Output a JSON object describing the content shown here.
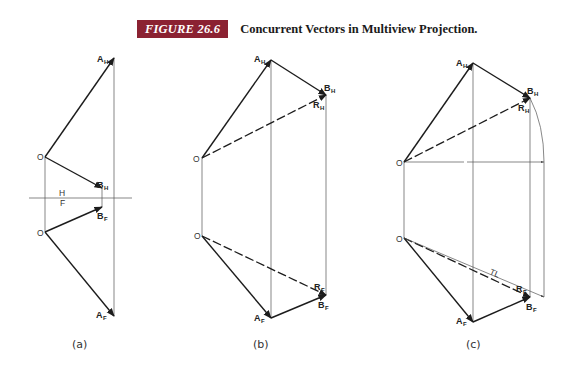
{
  "caption": {
    "figure_label": "FIGURE 26.6",
    "title": "Concurrent Vectors in Multiview Projection.",
    "badge_color": "#8b2232"
  },
  "panels": [
    {
      "id": "a",
      "label": "(a)",
      "points": {
        "O_top": "O",
        "A_H": "A",
        "A_H_sub": "H",
        "B_H": "B",
        "B_H_sub": "H",
        "O_bottom": "O",
        "B_F": "B",
        "B_F_sub": "F",
        "A_F": "A",
        "A_F_sub": "F"
      },
      "fold_line": {
        "upper": "H",
        "lower": "F"
      }
    },
    {
      "id": "b",
      "label": "(b)",
      "points": {
        "O_top": "O",
        "A_H": "A",
        "A_H_sub": "H",
        "B_H": "B",
        "B_H_sub": "H",
        "R_H": "R",
        "R_H_sub": "H",
        "O_bottom": "O",
        "R_F": "R",
        "R_F_sub": "F",
        "B_F": "B",
        "B_F_sub": "F",
        "A_F": "A",
        "A_F_sub": "F"
      }
    },
    {
      "id": "c",
      "label": "(c)",
      "points": {
        "O_top": "O",
        "A_H": "A",
        "A_H_sub": "H",
        "B_H": "B",
        "B_H_sub": "H",
        "R_H": "R",
        "R_H_sub": "H",
        "O_bottom": "O",
        "R_F": "R",
        "R_F_sub": "F",
        "B_F": "B",
        "B_F_sub": "F",
        "A_F": "A",
        "A_F_sub": "F"
      },
      "annotation": "TL"
    }
  ]
}
